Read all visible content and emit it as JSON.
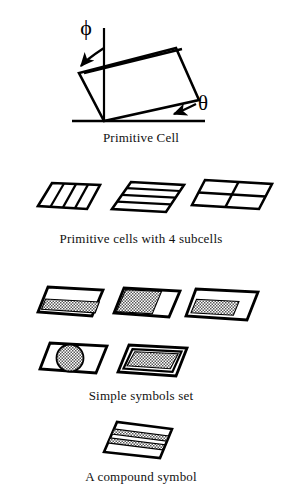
{
  "figure": {
    "background_color": "#ffffff",
    "ink_color": "#000000",
    "hatch_color": "#8a8a8a"
  },
  "panels": [
    {
      "id": "primitive-cell",
      "caption": "Primitive Cell",
      "angle_labels": {
        "phi": "ϕ",
        "theta": "θ"
      },
      "description": "Tilted parallelogram primitive cell with vertical reference line, horizontal baseline, angle phi from vertical and angle theta from horizontal"
    },
    {
      "id": "subcells",
      "caption": "Primitive cells with 4 subcells",
      "cells": [
        {
          "id": "subcell-vertical-strips",
          "subdivision": "4 vertical strips"
        },
        {
          "id": "subcell-horizontal-strips",
          "subdivision": "4 horizontal strips"
        },
        {
          "id": "subcell-two-by-two",
          "subdivision": "2 by 2 grid"
        }
      ]
    },
    {
      "id": "simple-symbols",
      "caption": "Simple symbols set",
      "symbols": [
        {
          "id": "symbol-bottom-band-filled",
          "fill": "lower band hatched, upper band white"
        },
        {
          "id": "symbol-left-filled",
          "fill": "left portion hatched, right portion white"
        },
        {
          "id": "symbol-inset-filled",
          "fill": "inset hatched block in lower left, white border band"
        },
        {
          "id": "symbol-circle-filled",
          "fill": "hatched circle centered in outlined cell"
        },
        {
          "id": "symbol-nested-filled",
          "fill": "nested parallelogram with hatched interior"
        }
      ]
    },
    {
      "id": "compound-symbol",
      "caption": "A compound symbol",
      "bands": [
        "white",
        "hatched",
        "white",
        "hatched",
        "white"
      ]
    }
  ]
}
